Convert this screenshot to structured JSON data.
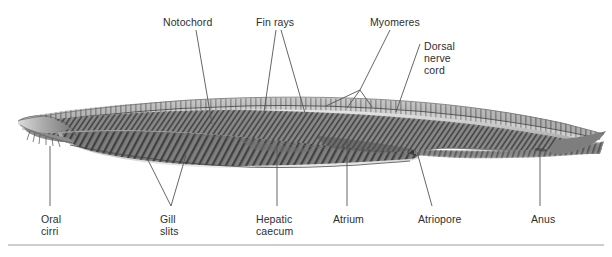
{
  "figure": {
    "background_color": "#ffffff",
    "label_color": "#2e2e2e",
    "leader_color": "#555555",
    "rule_color": "#9a9a9a",
    "body_tone_dark": "#4a4a4a",
    "body_tone_mid": "#8d8d8d",
    "body_tone_light": "#cfcfcf"
  },
  "labels": [
    {
      "id": "notochord",
      "text": "Notochord",
      "x": 163,
      "y": 16
    },
    {
      "id": "fin-rays",
      "text": "Fin rays",
      "x": 256,
      "y": 16
    },
    {
      "id": "myomeres",
      "text": "Myomeres",
      "x": 370,
      "y": 16
    },
    {
      "id": "dorsal-nerve-cord-1",
      "text": "Dorsal",
      "x": 424,
      "y": 40
    },
    {
      "id": "dorsal-nerve-cord-2",
      "text": "nerve",
      "x": 424,
      "y": 52
    },
    {
      "id": "dorsal-nerve-cord-3",
      "text": "cord",
      "x": 424,
      "y": 64
    },
    {
      "id": "oral-cirri-1",
      "text": "Oral",
      "x": 41,
      "y": 213
    },
    {
      "id": "oral-cirri-2",
      "text": "cirri",
      "x": 41,
      "y": 225
    },
    {
      "id": "gill-slits-1",
      "text": "Gill",
      "x": 160,
      "y": 213
    },
    {
      "id": "gill-slits-2",
      "text": "slits",
      "x": 160,
      "y": 225
    },
    {
      "id": "hepatic-caecum-1",
      "text": "Hepatic",
      "x": 256,
      "y": 213
    },
    {
      "id": "hepatic-caecum-2",
      "text": "caecum",
      "x": 256,
      "y": 225
    },
    {
      "id": "atrium",
      "text": "Atrium",
      "x": 333,
      "y": 213
    },
    {
      "id": "atriopore",
      "text": "Atriopore",
      "x": 418,
      "y": 213
    },
    {
      "id": "anus",
      "text": "Anus",
      "x": 531,
      "y": 213
    }
  ],
  "structures": [
    "Notochord",
    "Fin rays",
    "Myomeres",
    "Dorsal nerve cord",
    "Oral cirri",
    "Gill slits",
    "Hepatic caecum",
    "Atrium",
    "Atriopore",
    "Anus"
  ]
}
